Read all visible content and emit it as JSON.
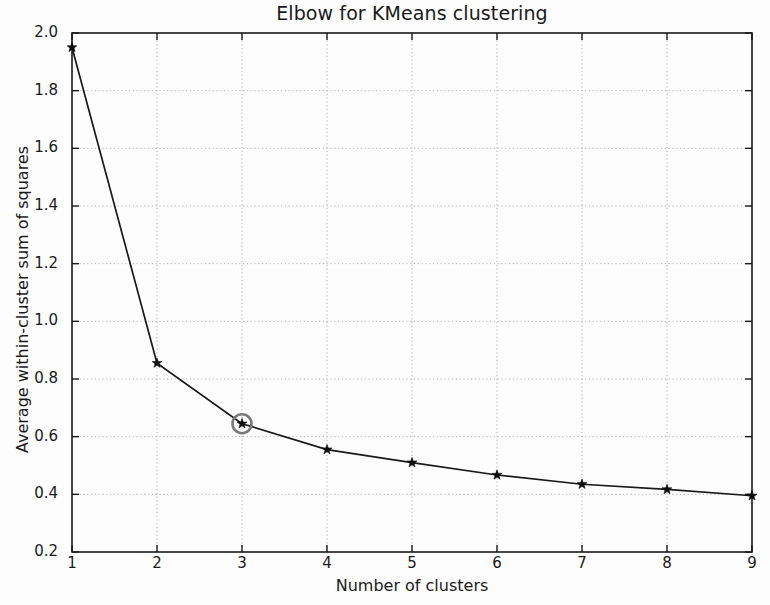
{
  "chart_data": {
    "type": "line",
    "title": "Elbow for KMeans clustering",
    "xlabel": "Number of clusters",
    "ylabel": "Average within-cluster sum of squares",
    "x": [
      1,
      2,
      3,
      4,
      5,
      6,
      7,
      8,
      9
    ],
    "values": [
      1.95,
      0.855,
      0.645,
      0.555,
      0.51,
      0.467,
      0.435,
      0.417,
      0.395
    ],
    "xlim": [
      1,
      9
    ],
    "ylim": [
      0.2,
      2.0
    ],
    "xticks": [
      "1",
      "2",
      "3",
      "4",
      "5",
      "6",
      "7",
      "8",
      "9"
    ],
    "yticks": [
      "0.2",
      "0.4",
      "0.6",
      "0.8",
      "1.0",
      "1.2",
      "1.4",
      "1.6",
      "1.8",
      "2.0"
    ],
    "grid": true,
    "legend": null,
    "marker": "star",
    "line_color": "#1a1a1a",
    "grid_color": "#b0b0b0",
    "annotations": [
      {
        "type": "circle-highlight",
        "x": 3,
        "y": 0.645,
        "color": "#7a7a7a",
        "label": "elbow-point"
      }
    ]
  }
}
